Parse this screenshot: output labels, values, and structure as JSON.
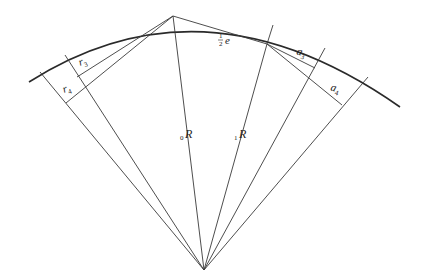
{
  "diagram": {
    "colors": {
      "stroke": "#2a2a2a",
      "background": "#ffffff"
    },
    "labels": {
      "r3": {
        "main": "r",
        "sub": "3"
      },
      "r4": {
        "main": "r",
        "sub": "4"
      },
      "a3": {
        "main": "a",
        "sub": "3"
      },
      "a4": {
        "main": "a",
        "sub": "4"
      },
      "half_e": {
        "frac_num": "1",
        "frac_den": "2",
        "main": "e"
      },
      "R0": {
        "pre": "0",
        "main": "R"
      },
      "R1": {
        "pre": "1",
        "main": "R"
      }
    }
  }
}
